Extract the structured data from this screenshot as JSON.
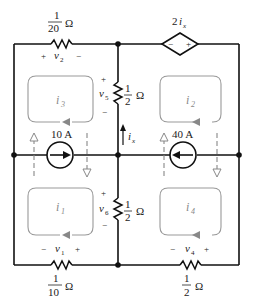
{
  "circuit": {
    "resistors": {
      "r_top_left": {
        "num": "1",
        "den": "20",
        "unit": "Ω",
        "voltage": "v",
        "voltage_sub": "2",
        "plus": "+",
        "minus": "−"
      },
      "r_center_upper": {
        "num": "1",
        "den": "2",
        "unit": "Ω",
        "voltage": "v",
        "voltage_sub": "5",
        "plus": "+",
        "minus": "−"
      },
      "r_center_lower": {
        "num": "1",
        "den": "2",
        "unit": "Ω",
        "voltage": "v",
        "voltage_sub": "6",
        "plus": "+",
        "minus": "−"
      },
      "r_bottom_left": {
        "num": "1",
        "den": "10",
        "unit": "Ω",
        "voltage": "v",
        "voltage_sub": "1",
        "plus": "+",
        "minus": "−"
      },
      "r_bottom_right": {
        "num": "1",
        "den": "2",
        "unit": "Ω",
        "voltage": "v",
        "voltage_sub": "4",
        "plus": "+",
        "minus": "−"
      }
    },
    "sources": {
      "dependent": {
        "label_coef": "2",
        "label_var": "i",
        "label_sub": "x",
        "minus": "−",
        "plus": "+"
      },
      "current_left": {
        "label": "10 A",
        "direction": "right"
      },
      "current_right": {
        "label": "40 A",
        "direction": "left"
      }
    },
    "branch_current": {
      "label": "i",
      "sub": "x"
    },
    "meshes": [
      {
        "label": "i",
        "sub": "1"
      },
      {
        "label": "i",
        "sub": "2"
      },
      {
        "label": "i",
        "sub": "3"
      },
      {
        "label": "i",
        "sub": "4"
      }
    ],
    "colors": {
      "wire": "#111111",
      "mesh": "#999999",
      "background": "#ffffff"
    }
  }
}
